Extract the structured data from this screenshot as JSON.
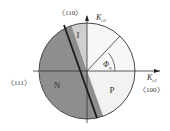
{
  "diagram": {
    "title": "",
    "regions": [
      {
        "id": "I",
        "label": "I",
        "fill": "#cfcfcf"
      },
      {
        "id": "N",
        "label": "N",
        "fill": "#8e8e8e"
      },
      {
        "id": "P",
        "label": "P",
        "fill": "#f2f2f2"
      }
    ],
    "axes": {
      "horizontal": {
        "label_main": "K",
        "label_sub": "c1"
      },
      "vertical": {
        "label_main": "K",
        "label_sub": "c2"
      }
    },
    "directions": {
      "top": "〈110〉",
      "left": "〈111〉",
      "right": "〈100〉"
    },
    "angle": {
      "label_main": "Φ",
      "label_sub": "q"
    },
    "colors": {
      "stroke": "#333333",
      "thick_line": "#1a1a1a"
    }
  }
}
